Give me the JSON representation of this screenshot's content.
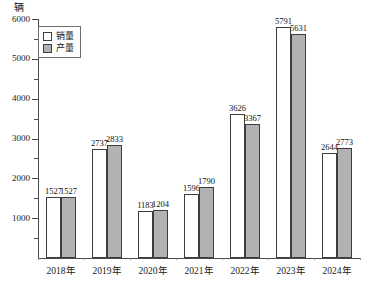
{
  "chart_data": {
    "type": "bar",
    "title": "",
    "subtitle": "",
    "xlabel": "",
    "ylabel": "辆",
    "unit_label": "辆",
    "categories": [
      "2018年",
      "2019年",
      "2020年",
      "2021年",
      "2022年",
      "2023年",
      "2024年"
    ],
    "series": [
      {
        "name": "销量",
        "color": "#ffffff",
        "values": [
          1527,
          2737,
          1183,
          1596,
          3626,
          5791,
          2644
        ]
      },
      {
        "name": "产量",
        "color": "#b2b2b2",
        "values": [
          1527,
          2833,
          1204,
          1790,
          3367,
          5631,
          2773
        ]
      }
    ],
    "ylim": [
      0,
      6000
    ],
    "ytick_labels": [
      "1000",
      "2000",
      "3000",
      "4000",
      "5000",
      "6000"
    ],
    "ytick_values": [
      1000,
      2000,
      3000,
      4000,
      5000,
      6000
    ],
    "yminor_step": 500,
    "grid": false,
    "legend_position": "top-left",
    "data_labels": true
  },
  "legend": {
    "items": [
      {
        "label": "销量",
        "swatch": "sales"
      },
      {
        "label": "产量",
        "swatch": "output"
      }
    ]
  }
}
